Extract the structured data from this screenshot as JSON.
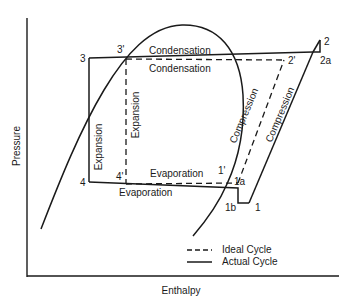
{
  "diagram": {
    "axes": {
      "x_label": "Enthalpy",
      "y_label": "Pressure"
    },
    "points": {
      "p3": "3",
      "p3_prime": "3'",
      "p2": "2",
      "p2a": "2a",
      "p2_prime": "2'",
      "p4": "4",
      "p4_prime": "4'",
      "p1_prime": "1'",
      "p1a": "1a",
      "p1b": "1b",
      "p1": "1"
    },
    "process_labels": {
      "condensation_actual": "Condensation",
      "condensation_ideal": "Condensation",
      "expansion_actual": "Expansion",
      "expansion_ideal": "Expansion",
      "evaporation_ideal": "Evaporation",
      "evaporation_actual": "Evaporation",
      "compression_ideal": "Compression",
      "compression_actual": "Compression"
    },
    "legend": {
      "ideal": "Ideal Cycle",
      "actual": "Actual Cycle"
    },
    "colors": {
      "line": "#1a1a1a",
      "background": "#ffffff"
    }
  }
}
